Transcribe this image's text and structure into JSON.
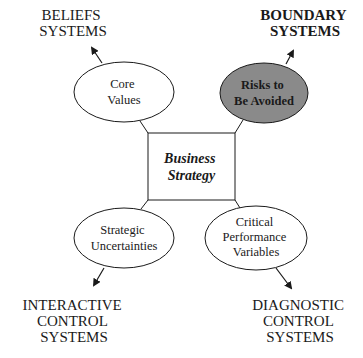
{
  "diagram": {
    "center": {
      "line1": "Business",
      "line2": "Strategy"
    },
    "nodes": {
      "top_left": {
        "line1": "Core",
        "line2": "Values",
        "fill": "#ffffff"
      },
      "top_right": {
        "line1": "Risks to",
        "line2": "Be Avoided",
        "fill": "#8a8a8a"
      },
      "bottom_left": {
        "line1": "Strategic",
        "line2": "Uncertainties",
        "fill": "#ffffff"
      },
      "bottom_right": {
        "line1": "Critical",
        "line2": "Performance",
        "line3": "Variables",
        "fill": "#ffffff"
      }
    },
    "systems": {
      "top_left": {
        "line1": "BELIEFS",
        "line2": "SYSTEMS"
      },
      "top_right": {
        "line1": "BOUNDARY",
        "line2": "SYSTEMS"
      },
      "bottom_left": {
        "line1": "INTERACTIVE",
        "line2": "CONTROL",
        "line3": "SYSTEMS"
      },
      "bottom_right": {
        "line1": "DIAGNOSTIC",
        "line2": "CONTROL",
        "line3": "SYSTEMS"
      }
    },
    "colors": {
      "stroke": "#1a1a1a",
      "shaded_fill": "#8a8a8a",
      "background": "#ffffff"
    }
  }
}
